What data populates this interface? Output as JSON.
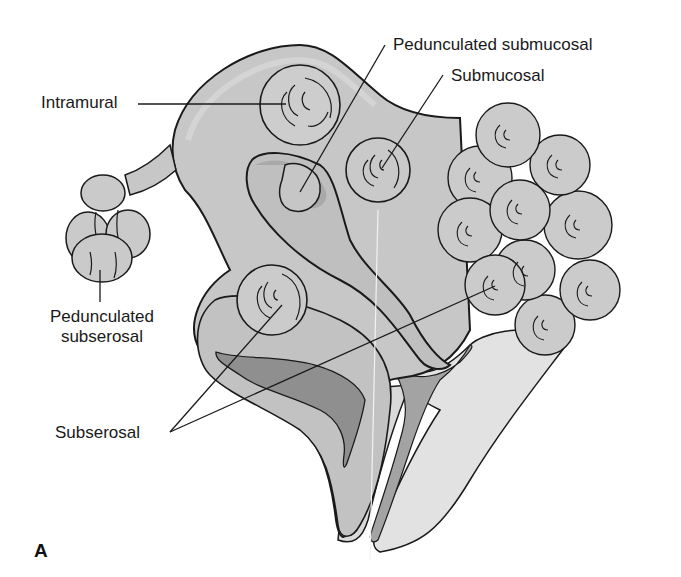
{
  "figure": {
    "panel_letter": "A",
    "colors": {
      "background": "#ffffff",
      "uterus_fill": "#c9c9c9",
      "uterus_rim": "#dedede",
      "cavity_fill": "#a9a9a9",
      "lumen_fill": "#8f8f8f",
      "fibroid_fill": "#cdcdcd",
      "outline": "#1a1a1a"
    },
    "labels": {
      "intramural": "Intramural",
      "pedunculated_submucosal": "Pedunculated submucosal",
      "submucosal": "Submucosal",
      "pedunculated_subserosal_line1": "Pedunculated",
      "pedunculated_subserosal_line2": "subserosal",
      "subserosal": "Subserosal"
    }
  }
}
